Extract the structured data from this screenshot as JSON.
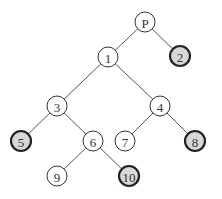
{
  "diagram": {
    "type": "tree",
    "nodes": [
      {
        "id": "P",
        "label": "P",
        "x": 145,
        "y": 22,
        "highlighted": false
      },
      {
        "id": "1",
        "label": "1",
        "x": 108,
        "y": 57,
        "highlighted": false
      },
      {
        "id": "2",
        "label": "2",
        "x": 180,
        "y": 56,
        "highlighted": true
      },
      {
        "id": "3",
        "label": "3",
        "x": 57,
        "y": 106,
        "highlighted": false
      },
      {
        "id": "4",
        "label": "4",
        "x": 160,
        "y": 106,
        "highlighted": false
      },
      {
        "id": "5",
        "label": "5",
        "x": 21,
        "y": 141,
        "highlighted": true
      },
      {
        "id": "6",
        "label": "6",
        "x": 93,
        "y": 141,
        "highlighted": false
      },
      {
        "id": "7",
        "label": "7",
        "x": 125,
        "y": 141,
        "highlighted": false
      },
      {
        "id": "8",
        "label": "8",
        "x": 195,
        "y": 141,
        "highlighted": true
      },
      {
        "id": "9",
        "label": "9",
        "x": 57,
        "y": 176,
        "highlighted": false
      },
      {
        "id": "10",
        "label": "10",
        "x": 129,
        "y": 176,
        "highlighted": true
      }
    ],
    "edges": [
      [
        "P",
        "1"
      ],
      [
        "P",
        "2"
      ],
      [
        "1",
        "3"
      ],
      [
        "1",
        "4"
      ],
      [
        "3",
        "5"
      ],
      [
        "3",
        "6"
      ],
      [
        "4",
        "7"
      ],
      [
        "4",
        "8"
      ],
      [
        "6",
        "9"
      ],
      [
        "6",
        "10"
      ]
    ],
    "node_radius": 10,
    "colors": {
      "highlight_fill": "#d8d8d8",
      "normal_fill": "#ffffff",
      "stroke": "#333333"
    }
  }
}
